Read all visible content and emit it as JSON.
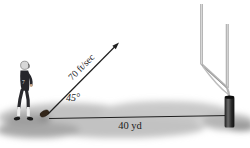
{
  "figure": {
    "labels": {
      "velocity": "70 ft/sec",
      "angle": "45°",
      "distance": "40 yd"
    },
    "jersey_number": "7",
    "measurements": {
      "initial_speed_ft_per_sec": 70,
      "launch_angle_deg": 45,
      "distance_yd": 40
    },
    "colors": {
      "background": "#ffffff",
      "ink": "#1a1a1a",
      "ground_shade": "#c2c2c2",
      "goalpost_tube": "#b4b4b4",
      "goalpost_base_dark": "#1c1c1c",
      "jersey": "#26262b",
      "helmet": "#d8d8d8",
      "skin": "#c9a88a",
      "football": "#33261a"
    }
  }
}
